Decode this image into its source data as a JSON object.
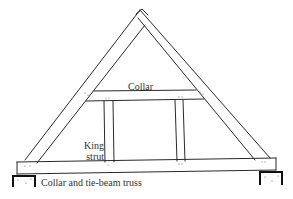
{
  "diagram": {
    "title": "Collar and tie-beam truss",
    "labels": {
      "collar": "Collar",
      "king_strut_line1": "King",
      "king_strut_line2": "strut"
    },
    "components": [
      "rafters",
      "collar",
      "king struts",
      "tie-beam",
      "wall plates/supports"
    ],
    "colors": {
      "line": "#2a2a2a",
      "background": "#ffffff"
    }
  }
}
